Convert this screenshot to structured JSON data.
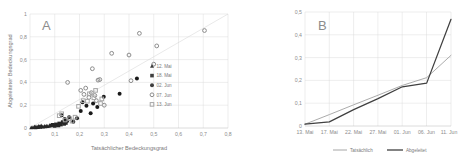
{
  "figure": {
    "panels": [
      {
        "letter": "A"
      },
      {
        "letter": "B"
      }
    ]
  },
  "chart_data": [
    {
      "type": "scatter",
      "title": "A",
      "xlabel": "Tatsächlicher Bedeckungsgrad",
      "ylabel": "Abgeleiteter Bedeckungsgrad",
      "xlim": [
        0,
        0.8
      ],
      "ylim": [
        0,
        1
      ],
      "xticks": [
        "0",
        "0,1",
        "0,2",
        "0,3",
        "0,4",
        "0,5",
        "0,6",
        "0,7",
        "0,8"
      ],
      "yticks": [
        "0",
        "0,2",
        "0,4",
        "0,6",
        "0,8",
        "1"
      ],
      "grid": true,
      "legend_position": "inside-right",
      "legend": [
        {
          "label": "12. Mai",
          "marker": "triangle",
          "color": "#3f3f3f"
        },
        {
          "label": "18. Mai",
          "marker": "square",
          "color": "#3f3f3f"
        },
        {
          "label": "02. Jun",
          "marker": "circle",
          "color": "#3f3f3f"
        },
        {
          "label": "07. Jun",
          "marker": "circle-open",
          "color": "#8c8c8c"
        },
        {
          "label": "13. Jun",
          "marker": "square-open",
          "color": "#a6a6a6"
        }
      ],
      "series": [
        {
          "name": "12. Mai",
          "marker": "triangle",
          "color": "#262626",
          "points": [
            [
              0.005,
              0.004
            ],
            [
              0.012,
              0.006
            ],
            [
              0.018,
              0.008
            ],
            [
              0.022,
              0.005
            ],
            [
              0.028,
              0.01
            ],
            [
              0.032,
              0.007
            ],
            [
              0.038,
              0.012
            ],
            [
              0.042,
              0.009
            ],
            [
              0.048,
              0.014
            ],
            [
              0.052,
              0.011
            ],
            [
              0.058,
              0.016
            ],
            [
              0.062,
              0.013
            ],
            [
              0.068,
              0.018
            ],
            [
              0.072,
              0.015
            ],
            [
              0.078,
              0.02
            ],
            [
              0.02,
              0.012
            ],
            [
              0.035,
              0.016
            ],
            [
              0.045,
              0.02
            ]
          ]
        },
        {
          "name": "18. Mai",
          "marker": "square",
          "color": "#262626",
          "points": [
            [
              0.085,
              0.022
            ],
            [
              0.092,
              0.028
            ],
            [
              0.098,
              0.024
            ],
            [
              0.105,
              0.032
            ],
            [
              0.11,
              0.026
            ],
            [
              0.118,
              0.04
            ],
            [
              0.125,
              0.03
            ],
            [
              0.132,
              0.052
            ],
            [
              0.138,
              0.036
            ],
            [
              0.145,
              0.044
            ],
            [
              0.1,
              0.018
            ],
            [
              0.115,
              0.022
            ]
          ]
        },
        {
          "name": "02. Jun",
          "marker": "circle",
          "color": "#1a1a1a",
          "points": [
            [
              0.128,
              0.112
            ],
            [
              0.14,
              0.078
            ],
            [
              0.15,
              0.062
            ],
            [
              0.158,
              0.095
            ],
            [
              0.175,
              0.055
            ],
            [
              0.205,
              0.15
            ],
            [
              0.212,
              0.225
            ],
            [
              0.228,
              0.195
            ],
            [
              0.255,
              0.215
            ],
            [
              0.272,
              0.185
            ],
            [
              0.298,
              0.275
            ],
            [
              0.362,
              0.3
            ],
            [
              0.432,
              0.435
            ],
            [
              0.19,
              0.085
            ],
            [
              0.245,
              0.13
            ]
          ]
        },
        {
          "name": "07. Jun",
          "marker": "circle-open",
          "color": "#8c8c8c",
          "points": [
            [
              0.152,
              0.4
            ],
            [
              0.205,
              0.33
            ],
            [
              0.218,
              0.295
            ],
            [
              0.225,
              0.35
            ],
            [
              0.238,
              0.268
            ],
            [
              0.248,
              0.31
            ],
            [
              0.252,
              0.52
            ],
            [
              0.262,
              0.285
            ],
            [
              0.268,
              0.24
            ],
            [
              0.275,
              0.42
            ],
            [
              0.282,
              0.425
            ],
            [
              0.3,
              0.2
            ],
            [
              0.33,
              0.655
            ],
            [
              0.4,
              0.64
            ],
            [
              0.408,
              0.415
            ],
            [
              0.442,
              0.83
            ],
            [
              0.5,
              0.56
            ],
            [
              0.512,
              0.72
            ],
            [
              0.705,
              0.855
            ]
          ]
        },
        {
          "name": "13. Jun",
          "marker": "square-open",
          "color": "#a6a6a6",
          "points": [
            [
              0.118,
              0.108
            ],
            [
              0.128,
              0.125
            ],
            [
              0.142,
              0.07
            ],
            [
              0.16,
              0.082
            ],
            [
              0.17,
              0.06
            ],
            [
              0.182,
              0.095
            ],
            [
              0.196,
              0.19
            ],
            [
              0.215,
              0.24
            ],
            [
              0.232,
              0.235
            ],
            [
              0.24,
              0.3
            ],
            [
              0.258,
              0.265
            ],
            [
              0.265,
              0.33
            ],
            [
              0.285,
              0.215
            ],
            [
              0.29,
              0.255
            ]
          ]
        }
      ],
      "reference_line": {
        "from": [
          0,
          0
        ],
        "to": [
          0.8,
          1.0
        ],
        "style": "light-gray"
      }
    },
    {
      "type": "line",
      "title": "B",
      "xlabel": "",
      "ylabel": "",
      "ylim": [
        0,
        0.5
      ],
      "yticks": [
        "0",
        "0,1",
        "0,2",
        "0,3",
        "0,4",
        "0,5"
      ],
      "categories": [
        "13. Mai",
        "17. Mai",
        "22. Mai",
        "27. Mai",
        "01. Jun",
        "06. Jun",
        "11. Jun"
      ],
      "grid": true,
      "legend_position": "bottom",
      "series": [
        {
          "name": "Tatsächlich",
          "color": "#a6a6a6",
          "values": [
            0.008,
            0.05,
            0.093,
            0.135,
            0.178,
            0.212,
            0.31
          ]
        },
        {
          "name": "Abgeleitet",
          "color": "#404040",
          "values": [
            0.008,
            0.018,
            0.072,
            0.12,
            0.172,
            0.188,
            0.468
          ]
        }
      ]
    }
  ]
}
